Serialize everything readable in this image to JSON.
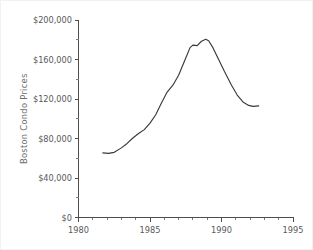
{
  "chart_data": {
    "type": "line",
    "title": "",
    "xlabel": "",
    "ylabel": "Boston Condo Prices",
    "xlim": [
      1980,
      1995
    ],
    "ylim": [
      0,
      200000
    ],
    "grid": false,
    "legend": false,
    "x_ticks": [
      1980,
      1985,
      1990,
      1995
    ],
    "x_tick_labels": [
      "1980",
      "1985",
      "1990",
      "1995"
    ],
    "x_minor_tick_step": 1,
    "y_ticks": [
      0,
      40000,
      80000,
      120000,
      160000,
      200000
    ],
    "y_tick_labels": [
      "$0",
      "$40,000",
      "$80,000",
      "$120,000",
      "$160,000",
      "$200,000"
    ],
    "y_minor_tick_step": 20000,
    "series": [
      {
        "name": "Boston Condo Prices",
        "color": "#3a3a3a",
        "x": [
          1981.7,
          1982.1,
          1982.5,
          1983.0,
          1983.4,
          1983.8,
          1984.2,
          1984.6,
          1985.0,
          1985.4,
          1985.8,
          1986.2,
          1986.6,
          1987.0,
          1987.4,
          1987.8,
          1988.0,
          1988.3,
          1988.6,
          1988.9,
          1989.1,
          1989.4,
          1989.8,
          1990.2,
          1990.7,
          1991.1,
          1991.5,
          1991.9,
          1992.2,
          1992.6
        ],
        "y": [
          65500,
          65000,
          66000,
          70500,
          75000,
          80500,
          85000,
          89000,
          95500,
          104000,
          116000,
          127000,
          134000,
          144000,
          158000,
          172000,
          174500,
          174000,
          178500,
          180500,
          179000,
          172000,
          160000,
          148000,
          134000,
          124000,
          117000,
          113500,
          112500,
          113000
        ],
        "units": "USD",
        "start_year": 1982,
        "end_year": 1993,
        "peak": {
          "year": 1989,
          "value": 180500
        },
        "trough_start": {
          "year": 1982,
          "value": 65000
        },
        "end_value": 113000
      }
    ]
  },
  "figure": {
    "background": "#ffffff",
    "border_color": "#f2f2f2",
    "axis_color": "#4d4d4d",
    "text_color": "#58595b",
    "axis_title_color": "#6d6e71"
  }
}
